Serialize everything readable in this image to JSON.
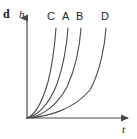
{
  "figure": {
    "panel_letter": "d",
    "axis": {
      "y_label": "h",
      "x_label": "t",
      "origin_x": 27,
      "origin_y": 118,
      "x_end": 128,
      "y_top": 18,
      "color": "#4a4a4a"
    }
  },
  "chart_data": {
    "type": "line",
    "title": "",
    "subtitle": "",
    "xlabel": "t",
    "ylabel": "h",
    "xlim": [
      0,
      1
    ],
    "ylim": [
      0,
      1
    ],
    "grid": false,
    "legend": "inline-curve-labels",
    "axis_ticks": {
      "x": [],
      "y": []
    },
    "annotations": [
      {
        "text": "d",
        "role": "panel-letter"
      }
    ],
    "note": "Four monotonic convex growth curves h(t) all starting at the origin; steepest rise is C, then A, then B, then D.",
    "series": [
      {
        "name": "C",
        "label_x": 50,
        "label_y": 17,
        "color": "#4a4a4a",
        "stroke_width": 1.1,
        "top_x": 56,
        "top_y": 28,
        "path": "M27,118 C33,116 41,106 48,82 C53,62 55,42 56,28",
        "x": [
          0.0,
          0.08,
          0.14,
          0.19,
          0.23,
          0.26,
          0.28,
          0.29
        ],
        "y": [
          0.0,
          0.03,
          0.09,
          0.22,
          0.42,
          0.63,
          0.82,
          1.0
        ]
      },
      {
        "name": "A",
        "label_x": 65,
        "label_y": 17,
        "color": "#4a4a4a",
        "stroke_width": 1.1,
        "top_x": 68,
        "top_y": 28,
        "path": "M27,118 C36,116 48,107 57,84 C64,64 67,42 68,28",
        "x": [
          0.0,
          0.11,
          0.21,
          0.3,
          0.36,
          0.39,
          0.4,
          0.41
        ],
        "y": [
          0.0,
          0.03,
          0.09,
          0.21,
          0.41,
          0.62,
          0.82,
          1.0
        ]
      },
      {
        "name": "B",
        "label_x": 79,
        "label_y": 17,
        "color": "#4a4a4a",
        "stroke_width": 1.1,
        "top_x": 81,
        "top_y": 28,
        "path": "M27,118 C39,117 55,109 67,87 C76,67 80,43 81,28",
        "x": [
          0.0,
          0.15,
          0.29,
          0.4,
          0.48,
          0.52,
          0.53,
          0.54
        ],
        "y": [
          0.0,
          0.02,
          0.08,
          0.2,
          0.39,
          0.6,
          0.81,
          1.0
        ]
      },
      {
        "name": "D",
        "label_x": 104,
        "label_y": 17,
        "color": "#4a4a4a",
        "stroke_width": 1.1,
        "top_x": 106,
        "top_y": 28,
        "path": "M27,118 C47,117 73,110 90,90 C100,72 105,45 106,28",
        "x": [
          0.0,
          0.25,
          0.47,
          0.63,
          0.73,
          0.78,
          0.78,
          0.78
        ],
        "y": [
          0.0,
          0.02,
          0.07,
          0.18,
          0.37,
          0.58,
          0.8,
          1.0
        ]
      }
    ]
  }
}
